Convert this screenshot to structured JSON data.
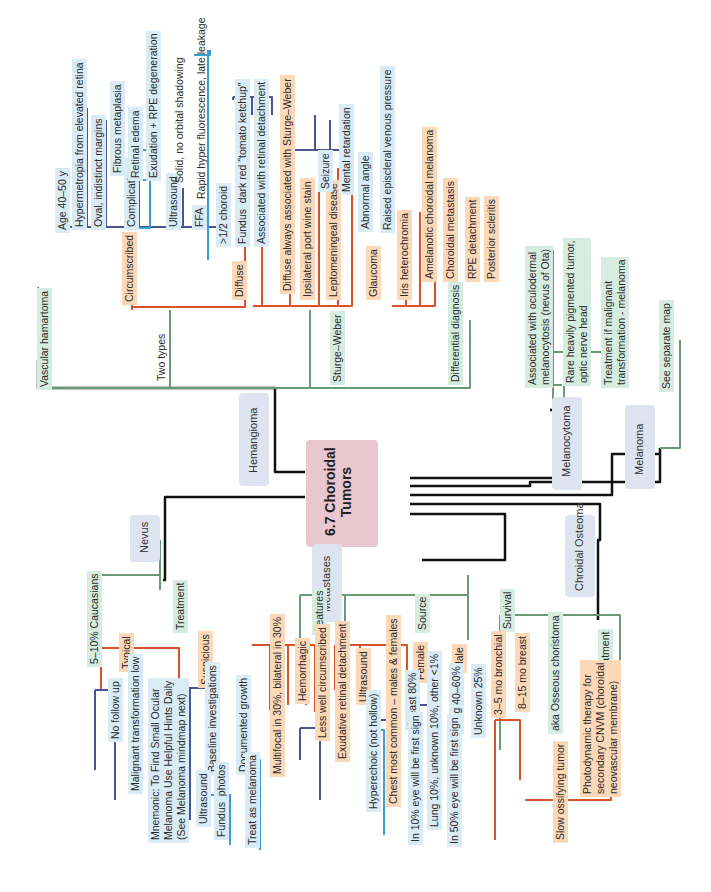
{
  "title": "6.7 Choroidal\nTumors",
  "colors": {
    "black": "#111111",
    "green": "#6a9a74",
    "orange": "#d7542a",
    "navy": "#4a5490",
    "blue": "#3a9fd0",
    "center": "#e8c7d1",
    "box": "#dde3ef"
  },
  "branches": {
    "hemangioma": {
      "label": "Hemangioma",
      "vascular": "Vascular hamartoma",
      "two_types": "Two types",
      "circumscribed": "Circumscribed",
      "circ_items": [
        "Age 40–50 y",
        "Hypermetropia from elevated retina",
        "Oval, indistinct margins",
        "Complications",
        "Ultrasound",
        "FFA"
      ],
      "complications": [
        "Fibrous metaplasia",
        "Retinal edema",
        "Exudation + RPE degeneration"
      ],
      "ultrasound": "Solid, no orbital shadowing",
      "ffa": "Rapid hyper fluorescence, late leakage",
      "diffuse": "Diffuse",
      "diffuse_items": [
        ">1/2 choroid",
        "Fundus  dark red \"tomato ketchup\"",
        "Associated with retinal detachment"
      ],
      "sturge_weber": "Sturge–Weber",
      "sw_items": [
        "Diffuse always associated with Sturge–Weber",
        "Ipsilateral port wine stain",
        "Leptomeningeal disease",
        "Glaucoma",
        "Iris heterochromia"
      ],
      "lepto": [
        "Seizure",
        "Mental retardation"
      ],
      "glaucoma": [
        "Abnormal angle",
        "Raised episcleral venous pressure"
      ],
      "differential": "Differential diagnosis",
      "dd_items": [
        "Amelanotic choroidal melanoma",
        "Choroidal metastasis",
        "RPE detachment",
        "Posterior scleritis"
      ]
    },
    "melanocytoma": {
      "label": "Melanocytoma",
      "items": [
        "Associated with oculodermal\nmelanocytosis (nevus of Ota)",
        "Rare heavily pigmented tumor,\noptic nerve head",
        "Treatment if malignant\ntransformation - melanoma"
      ]
    },
    "melanoma": {
      "label": "Melanoma",
      "item": "See separate map"
    },
    "nevus": {
      "label": "Nevus",
      "prevalence": "5–10% Caucasians",
      "treatment": "Treatment",
      "typical": "Typical",
      "typical_items": [
        "No follow up",
        "Malignant transformation low"
      ],
      "mnemonic": "Mnemonic: To Find Small Ocular\nMelanoma Use Helpful Hints Daily\n(See Melanoma mindmap next)",
      "suspicious": "Suspicious",
      "susp_items": [
        "Baseline investigations",
        "Documented growth"
      ],
      "baseline": [
        "Ultrasound",
        "Fundus  photos"
      ],
      "growth": "Treat as melanoma"
    },
    "metastases": {
      "label": "Metastases",
      "features": "Features",
      "feature_items": [
        "Multifocal in 30%, bilateral in 30%",
        "Hemorrhagic",
        "Less well circumscribed",
        "Exudative retinal detachment",
        "Ultrasound"
      ],
      "ultrasound": [
        "Hyperechoic (not hollow)",
        "Chest most common – males & females"
      ],
      "source": "Source",
      "female": "Female",
      "female_items": [
        "Breast 80%",
        "Lung 10%, unknown 10%, other <1%"
      ],
      "breast": "In 10% eye will be first sign",
      "male": "Male",
      "male_items": [
        "Lung 40–60%",
        "Unknown 25%"
      ],
      "lung": "In 50% eye will be first sign",
      "survival": "Survival",
      "survival_items": [
        "3–5 mo bronchial",
        "8–15 mo breast"
      ]
    },
    "osteoma": {
      "label": "Chroidal Osteoma",
      "aka": "aka Osseous choristoma",
      "slow": "Slow ossifying tumor",
      "treatment": "Treatment",
      "pdt": "Photodynamic therapy for\nsecondary CNVM (choroidal\nneovascular membrane)"
    }
  }
}
